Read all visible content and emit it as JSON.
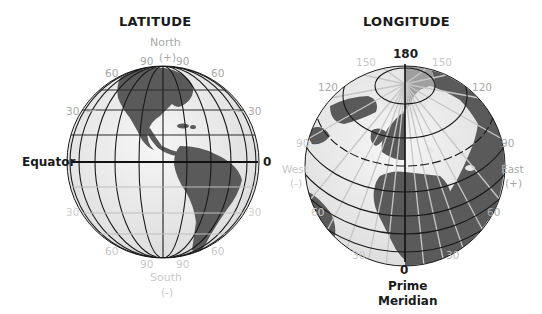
{
  "latitude": {
    "title": "LATITUDE",
    "north_label": "North",
    "north_sign": "(+)",
    "south_label": "South",
    "south_sign": "(-)",
    "equator_label": "Equator",
    "equator_value": "0",
    "ticks": {
      "top_left_90": "90",
      "top_right_90": "90",
      "upper_left_60": "60",
      "upper_right_60": "60",
      "upper_left_30": "30",
      "upper_right_30": "30",
      "lower_left_30": "30",
      "lower_right_30": "30",
      "lower_left_60": "60",
      "lower_right_60": "60",
      "bottom_left_90": "90",
      "bottom_right_90": "90"
    }
  },
  "longitude": {
    "title": "LONGITUDE",
    "top_value": "180",
    "west_label": "West",
    "west_sign": "(-)",
    "east_label": "East",
    "east_sign": "(+)",
    "prime_value": "0",
    "prime_label_line1": "Prime",
    "prime_label_line2": "Meridian",
    "ticks": {
      "left_150": "150",
      "right_150": "150",
      "left_120": "120",
      "right_120": "120",
      "left_90": "90",
      "right_90": "90",
      "left_60": "60",
      "right_60": "60",
      "left_30": "30",
      "right_30": "30"
    }
  },
  "colors": {
    "land": "#5a5a5a",
    "ocean": "#ececec",
    "grid_dark": "#1a1a1a",
    "grid_light": "#bdbdbd",
    "label_gray": "#a8a8a8"
  }
}
